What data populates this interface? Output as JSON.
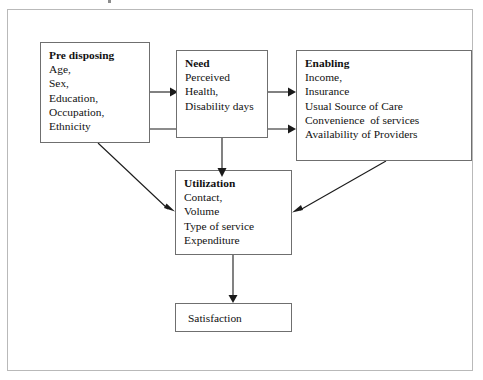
{
  "diagram": {
    "nodes": {
      "predisposing": {
        "title": "Pre disposing",
        "lines": [
          "Age,",
          "Sex,",
          "Education,",
          "Occupation,",
          "Ethnicity"
        ]
      },
      "need": {
        "title": "Need",
        "lines": [
          "Perceived",
          "Health,",
          "Disability days"
        ]
      },
      "enabling": {
        "title": "Enabling",
        "lines": [
          "Income,",
          "Insurance",
          "Usual Source of Care",
          "Convenience  of services",
          "Availability of Providers"
        ]
      },
      "utilization": {
        "title": "Utilization",
        "lines": [
          "Contact,",
          "Volume",
          "Type of service",
          "Expenditure"
        ]
      },
      "satisfaction": {
        "title": "",
        "lines": [
          "Satisfaction"
        ],
        "label": "Satisfaction"
      }
    },
    "edges": [
      {
        "id": "predisposing-to-need",
        "from": "predisposing",
        "to": "need",
        "style": "straight-arrow"
      },
      {
        "id": "need-to-enabling",
        "from": "need",
        "to": "enabling",
        "style": "straight-arrow"
      },
      {
        "id": "predisposing-to-enabling",
        "from": "predisposing",
        "to": "enabling",
        "style": "straight-arrow"
      },
      {
        "id": "predisposing-to-utilization",
        "from": "predisposing",
        "to": "utilization",
        "style": "diagonal-arrow"
      },
      {
        "id": "need-to-utilization",
        "from": "need",
        "to": "utilization",
        "style": "vertical-arrow"
      },
      {
        "id": "enabling-to-utilization",
        "from": "enabling",
        "to": "utilization",
        "style": "diagonal-arrow"
      },
      {
        "id": "utilization-to-satisfaction",
        "from": "utilization",
        "to": "satisfaction",
        "style": "vertical-arrow"
      }
    ],
    "colors": {
      "box_border": "#6f6f6f",
      "frame_border": "#b9b9b9",
      "arrow": "#1a1a1a",
      "text": "#111111",
      "background": "#ffffff"
    }
  }
}
